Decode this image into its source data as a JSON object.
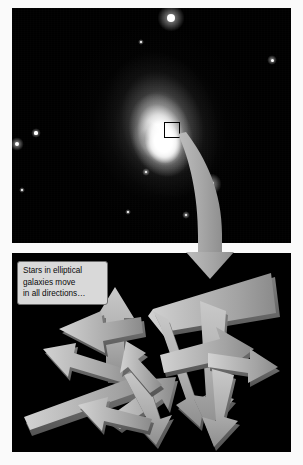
{
  "figure": {
    "title": "Stars in elliptical galaxies move in all directions",
    "background_color": "#ffffff",
    "panel_background": "#000000",
    "arrow_color": "#a8a8a8",
    "arrow_shade_color": "#6e6e6e",
    "width": 303,
    "height": 465
  },
  "galaxy_panel": {
    "name": "elliptical-galaxy-photograph",
    "description": "Black-and-white astronomical photograph of a bright elliptical galaxy with a glowing core and surrounding field stars",
    "inset_marker": {
      "label": "inset-region-box",
      "shape": "square",
      "border_color": "#000000",
      "x": 164,
      "y": 122,
      "size": 14
    },
    "stars": [
      {
        "name": "bright-star-top",
        "x": 171,
        "y": 18,
        "r": 4.2
      },
      {
        "name": "faint-star-upper-right",
        "x": 272,
        "y": 60,
        "r": 1.5
      },
      {
        "name": "faint-star-upper-mid",
        "x": 141,
        "y": 42,
        "r": 1.0
      },
      {
        "name": "faint-star-left-upper",
        "x": 36,
        "y": 133,
        "r": 1.6
      },
      {
        "name": "faint-star-left-lower",
        "x": 17,
        "y": 144,
        "r": 2.0
      },
      {
        "name": "bright-star-lower-right",
        "x": 211,
        "y": 184,
        "r": 3.2
      },
      {
        "name": "faint-star-inner-lower",
        "x": 146,
        "y": 172,
        "r": 1.3
      },
      {
        "name": "faint-star-bottom",
        "x": 186,
        "y": 215,
        "r": 1.1
      },
      {
        "name": "faint-star-far-left",
        "x": 22,
        "y": 190,
        "r": 0.9
      },
      {
        "name": "faint-star-lower-mid",
        "x": 128,
        "y": 212,
        "r": 0.9
      }
    ]
  },
  "connector_arrow": {
    "name": "zoom-connector-arrow",
    "description": "Wide curved grey arrow leading from the inset box on the galaxy down into the lower diagram panel",
    "color": "#a8a8a8",
    "head_direction": "down"
  },
  "callout": {
    "name": "explanation-callout",
    "lines": [
      "Stars in elliptical",
      "galaxies move",
      "in all directions…"
    ],
    "background_color": "#d9d9d9",
    "border_color": "#6d6d6d",
    "text_color": "#0a0a0a"
  },
  "arrows_panel": {
    "name": "random-stellar-motion-diagram",
    "description": "Many flat 3-D grey arrows pointing in every direction, representing randomly oriented stellar orbits",
    "arrow_count": 14,
    "arrows": [
      {
        "name": "arrow-up-center-left",
        "angle_deg": -92,
        "length": 96
      },
      {
        "name": "arrow-left-long-upper",
        "angle_deg": 170,
        "length": 125
      },
      {
        "name": "arrow-left-upper-short",
        "angle_deg": 196,
        "length": 78
      },
      {
        "name": "arrow-left-thin-mid",
        "angle_deg": 200,
        "length": 74
      },
      {
        "name": "arrow-down-left-long",
        "angle_deg": 214,
        "length": 150
      },
      {
        "name": "arrow-down-steep-center",
        "angle_deg": 100,
        "length": 112
      },
      {
        "name": "arrow-down-right-center",
        "angle_deg": 80,
        "length": 118
      },
      {
        "name": "arrow-right-lower",
        "angle_deg": -22,
        "length": 92
      },
      {
        "name": "arrow-right-far",
        "angle_deg": 8,
        "length": 86
      },
      {
        "name": "arrow-up-right-diagonal",
        "angle_deg": -34,
        "length": 88
      },
      {
        "name": "arrow-down-bottom-center",
        "angle_deg": 96,
        "length": 96
      },
      {
        "name": "arrow-down-right-bottom",
        "angle_deg": 70,
        "length": 104
      },
      {
        "name": "arrow-left-bottom",
        "angle_deg": 206,
        "length": 66
      },
      {
        "name": "arrow-up-left-small",
        "angle_deg": -130,
        "length": 60
      }
    ]
  }
}
